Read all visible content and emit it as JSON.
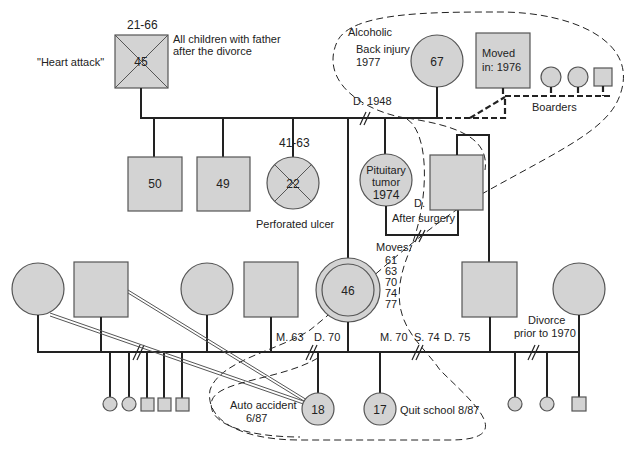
{
  "diagram": {
    "type": "genogram",
    "generation1": {
      "father": {
        "age": "45",
        "dates": "21-66",
        "cause": "\"Heart attack\"",
        "note_line1": "All children with father",
        "note_line2": "after the divorce"
      },
      "mother": {
        "age": "67",
        "note1": "Alcoholic",
        "note2": "Back injury",
        "note3": "1977"
      },
      "divorce": "D. 1948",
      "partner_moved_in": {
        "line1": "Moved",
        "line2": "in:  1976"
      },
      "boarders_label": "Boarders"
    },
    "generation2": {
      "son_50": {
        "age": "50"
      },
      "son_49": {
        "age": "49"
      },
      "daughter_22": {
        "age": "22",
        "dates": "41-63",
        "cause": "Perforated ulcer"
      },
      "daughter_pituitary": {
        "line1": "Pituitary",
        "line2": "tumor",
        "line3": "1974"
      },
      "son_after_surgery": {
        "note1": "D.",
        "note2": "After surgery"
      },
      "index_person": {
        "age": "46",
        "moves_label": "Moves:",
        "moves": [
          "61",
          "63",
          "70",
          "74",
          "77"
        ]
      },
      "marriage_labels": {
        "m63": "M. 63",
        "d70": "D. 70",
        "m70": "M. 70",
        "s74": "S. 74",
        "d75": "D. 75"
      },
      "divorce_prior": {
        "line1": "Divorce",
        "line2": "prior to 1970"
      }
    },
    "generation3": {
      "daughter_18": {
        "age": "18",
        "note1": "Auto accident",
        "note2": "6/87"
      },
      "daughter_17": {
        "age": "17",
        "note": "Quit school 8/87"
      }
    }
  }
}
